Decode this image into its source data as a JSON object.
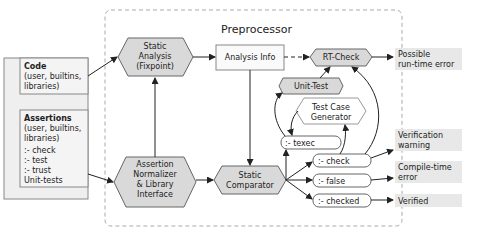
{
  "program": {
    "title": "Program",
    "code": {
      "title": "Code",
      "line1": "(user, builtins,",
      "line2": "libraries)"
    },
    "assertions": {
      "title": "Assertions",
      "line1": "(user, builtins,",
      "line2": "libraries)",
      "items": [
        ":- check",
        ":- test",
        ":- trust",
        "Unit-tests"
      ]
    }
  },
  "preprocessor": {
    "title": "Preprocessor",
    "static_analysis": {
      "l1": "Static",
      "l2": "Analysis",
      "l3": "(Fixpoint)"
    },
    "analysis_info": "Analysis Info",
    "rt_check": "RT-Check",
    "unit_test": "Unit-Test",
    "test_case_generator": {
      "l1": "Test Case",
      "l2": "Generator"
    },
    "assertion_normalizer": {
      "l1": "Assertion",
      "l2": "Normalizer",
      "l3": "& Library",
      "l4": "Interface"
    },
    "static_comparator": {
      "l1": "Static",
      "l2": "Comparator"
    },
    "texec": ":- texec",
    "check": ":- check",
    "false": ":- false",
    "checked": ":- checked"
  },
  "outputs": {
    "runtime": {
      "l1": "Possible",
      "l2": "run-time error"
    },
    "warning": {
      "l1": "Verification",
      "l2": "warning"
    },
    "compile": {
      "l1": "Compile-time",
      "l2": "error"
    },
    "verified": "Verified"
  },
  "colors": {
    "hex_fill": "#d9d9d9",
    "output_fill": "#e8e8e8",
    "stroke": "#555555",
    "dashed": "#aaaaaa"
  }
}
